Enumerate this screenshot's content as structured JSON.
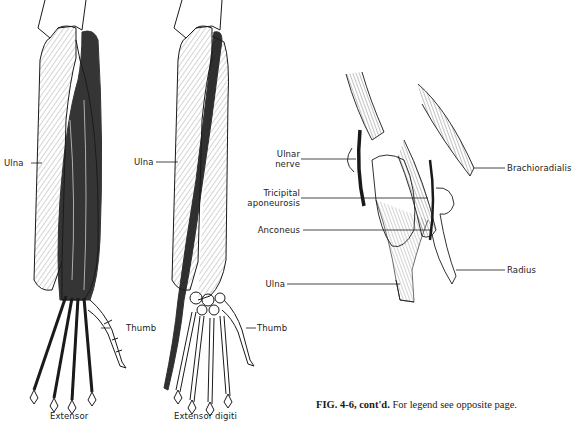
{
  "figure": {
    "panel_left": {
      "title": "Extensor",
      "labels": {
        "ulna": "Ulna",
        "thumb": "Thumb"
      }
    },
    "panel_middle": {
      "title": "Extensor digiti",
      "labels": {
        "ulna": "Ulna",
        "thumb": "Thumb"
      }
    },
    "panel_right": {
      "labels": {
        "ulnar_nerve_line1": "Ulnar",
        "ulnar_nerve_line2": "nerve",
        "tricipital_line1": "Tricipital",
        "tricipital_line2": "aponeurosis",
        "anconeus": "Anconeus",
        "ulna": "Ulna",
        "brachioradialis": "Brachioradialis",
        "radius": "Radius"
      }
    },
    "caption": {
      "label": "FIG. 4-6, cont'd.",
      "text": "For legend see opposite page."
    }
  },
  "colors": {
    "ink": "#1a1a1a",
    "paper": "#ffffff"
  }
}
